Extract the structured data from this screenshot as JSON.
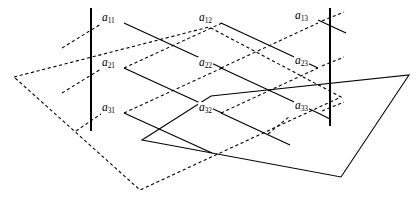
{
  "figure": {
    "stroke_color": "#000000",
    "background_color": "#ffffff"
  },
  "labels": [
    {
      "id": "a11",
      "base": "a",
      "sub": "11",
      "x": 101,
      "y": 18
    },
    {
      "id": "a12",
      "base": "a",
      "sub": "12",
      "x": 198,
      "y": 18
    },
    {
      "id": "a13",
      "base": "a",
      "sub": "13",
      "x": 293,
      "y": 16
    },
    {
      "id": "a21",
      "base": "a",
      "sub": "21",
      "x": 101,
      "y": 63
    },
    {
      "id": "a22",
      "base": "a",
      "sub": "22",
      "x": 198,
      "y": 63
    },
    {
      "id": "a23",
      "base": "a",
      "sub": "23",
      "x": 293,
      "y": 62
    },
    {
      "id": "a31",
      "base": "a",
      "sub": "31",
      "x": 101,
      "y": 108
    },
    {
      "id": "a32",
      "base": "a",
      "sub": "32",
      "x": 198,
      "y": 108
    },
    {
      "id": "a33",
      "base": "a",
      "sub": "33",
      "x": 293,
      "y": 107
    }
  ],
  "vertical_lines": [
    {
      "id": "left-vertical-line",
      "x1": 91,
      "y1": 8,
      "x2": 91,
      "y2": 131
    },
    {
      "id": "right-vertical-line",
      "x1": 330,
      "y1": 8,
      "x2": 330,
      "y2": 126
    }
  ],
  "solid_plane": {
    "id": "solid-parallelogram",
    "points": "211,96 409,75 341,177 142,140"
  },
  "dashed_planes": [
    {
      "id": "dashed-outer-parallelogram",
      "points": "14,77 209,27 341,97 140,190"
    }
  ],
  "solid_diagonals": [
    {
      "from": "a11",
      "x1": 124,
      "y1": 23,
      "x2": 222,
      "y2": 68
    },
    {
      "from": "a12",
      "x1": 221,
      "y1": 23,
      "x2": 318,
      "y2": 68
    },
    {
      "from": "a21",
      "x1": 124,
      "y1": 68,
      "x2": 222,
      "y2": 113
    },
    {
      "from": "a22",
      "x1": 221,
      "y1": 68,
      "x2": 318,
      "y2": 113
    },
    {
      "from": "a31",
      "x1": 124,
      "y1": 113,
      "x2": 290,
      "y2": 188
    },
    {
      "from": "a32",
      "x1": 221,
      "y1": 113,
      "x2": 290,
      "y2": 145
    }
  ],
  "dashed_diagonals": [
    {
      "from": "a31",
      "x1": 124,
      "y1": 113,
      "x2": 222,
      "y2": 68
    },
    {
      "from": "a32",
      "x1": 221,
      "y1": 113,
      "x2": 318,
      "y2": 68
    },
    {
      "from": "a21",
      "x1": 124,
      "y1": 68,
      "x2": 222,
      "y2": 23
    },
    {
      "from": "a22",
      "x1": 221,
      "y1": 68,
      "x2": 318,
      "y2": 23
    },
    {
      "from": "a11-up",
      "x1": 60,
      "y1": 47,
      "x2": 101,
      "y2": 22
    },
    {
      "from": "a21-up",
      "x1": 60,
      "y1": 92,
      "x2": 101,
      "y2": 67
    }
  ]
}
